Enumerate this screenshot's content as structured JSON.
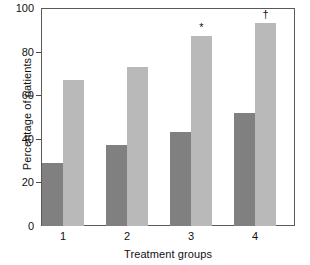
{
  "chart_data": {
    "type": "bar",
    "title": "",
    "subtitle": "",
    "xlabel": "Treatment groups",
    "ylabel": "Percentage of patients",
    "categories": [
      "1",
      "2",
      "3",
      "4"
    ],
    "series": [
      {
        "name": "dark-series",
        "color": "#808080",
        "values": [
          29,
          37,
          43,
          52
        ]
      },
      {
        "name": "light-series",
        "color": "#b9b9b9",
        "values": [
          67,
          73,
          87,
          93
        ]
      }
    ],
    "ylim": [
      0,
      100
    ],
    "yticks": [
      0,
      20,
      40,
      60,
      80,
      100
    ],
    "ytick_labels": [
      "0",
      "20",
      "40",
      "60",
      "80",
      "100"
    ],
    "grid": false,
    "legend": "none",
    "annotations": [
      {
        "text": "*",
        "group_index": 2,
        "series_index": 1
      },
      {
        "text": "†",
        "group_index": 3,
        "series_index": 1
      }
    ]
  },
  "axis": {
    "ylabel": "Percentage of patients",
    "xlabel": "Treatment groups",
    "ytick_0": "0",
    "ytick_1": "20",
    "ytick_2": "40",
    "ytick_3": "60",
    "ytick_4": "80",
    "ytick_5": "100",
    "xtick_0": "1",
    "xtick_1": "2",
    "xtick_2": "3",
    "xtick_3": "4"
  },
  "marks": {
    "asterisk": "*",
    "dagger": "†"
  },
  "colors": {
    "dark_bar": "#808080",
    "light_bar": "#b9b9b9",
    "frame": "#5a5a5a",
    "text": "#111111",
    "background": "#ffffff"
  }
}
